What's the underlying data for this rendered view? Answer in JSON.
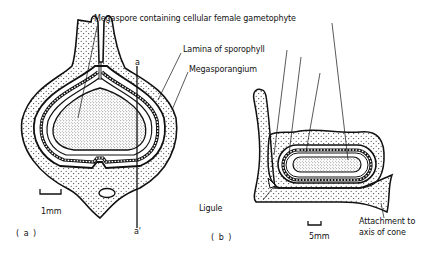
{
  "figure": {
    "panel_a": {
      "label": "( a )",
      "section_top": "a",
      "section_bottom": "a'",
      "scale_bar": "1mm"
    },
    "panel_b": {
      "label": "( b )",
      "scale_bar": "5mm"
    },
    "annotations": {
      "megaspore": "Megaspore containing cellular female gametophyte",
      "lamina": "Lamina of sporophyll",
      "megasporangium": "Megasporangium",
      "ligule": "Ligule",
      "attachment_line1": "Attachment to",
      "attachment_line2": "axis of cone"
    },
    "colors": {
      "ink": "#111111",
      "background": "#ffffff"
    }
  }
}
